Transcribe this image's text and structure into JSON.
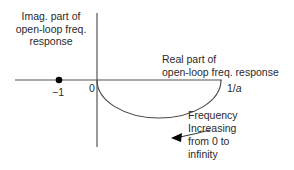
{
  "diagram": {
    "y_axis_label_lines": [
      "Imag. part of",
      "open-loop freq.",
      "response"
    ],
    "x_axis_label_lines": [
      "Real part of",
      "open-loop freq. response"
    ],
    "origin_label": "0",
    "critical_point_label": "−1",
    "intercept_label_prefix": "1/",
    "intercept_label_var": "a",
    "direction_note_lines": [
      "Frequency",
      "Increasing",
      "from 0 to",
      "infinity"
    ],
    "colors": {
      "axis": "#555555",
      "curve": "#444444",
      "point": "#000000",
      "arrow": "#000000"
    }
  }
}
